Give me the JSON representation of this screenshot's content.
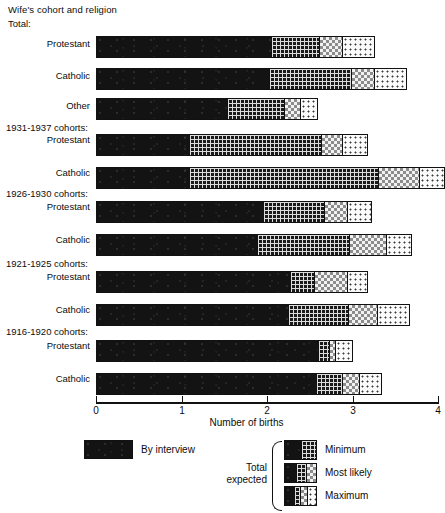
{
  "chart_data": {
    "type": "bar",
    "orientation": "horizontal",
    "stacked": true,
    "title": "",
    "xlabel": "Number of births",
    "ylabel": "Wife's cohort and religion",
    "xlim": [
      0,
      4
    ],
    "xticks": [
      "0",
      "1",
      "2",
      "3",
      "4"
    ],
    "grid": false,
    "legend_position": "below-plot",
    "series": [
      {
        "name": "By interview",
        "key": "interview"
      },
      {
        "name": "Minimum",
        "key": "minimum"
      },
      {
        "name": "Most likely",
        "key": "likely"
      },
      {
        "name": "Maximum",
        "key": "maximum"
      }
    ],
    "groups": [
      {
        "group_label": "Total:",
        "rows": [
          {
            "category": "Protestant",
            "interview": 2.05,
            "minimum": 2.62,
            "likely": 2.89,
            "maximum": 3.26
          },
          {
            "category": "Catholic",
            "interview": 2.02,
            "minimum": 2.99,
            "likely": 3.26,
            "maximum": 3.64
          },
          {
            "category": "Other",
            "interview": 1.54,
            "minimum": 2.21,
            "likely": 2.39,
            "maximum": 2.6
          }
        ]
      },
      {
        "group_label": "1931-1937 cohorts:",
        "rows": [
          {
            "category": "Protestant",
            "interview": 1.08,
            "minimum": 2.64,
            "likely": 2.89,
            "maximum": 3.18
          },
          {
            "category": "Catholic",
            "interview": 1.08,
            "minimum": 3.3,
            "likely": 3.79,
            "maximum": 4.08
          }
        ]
      },
      {
        "group_label": "1926-1930 cohorts:",
        "rows": [
          {
            "category": "Protestant",
            "interview": 1.95,
            "minimum": 2.68,
            "likely": 2.94,
            "maximum": 3.23
          },
          {
            "category": "Catholic",
            "interview": 1.88,
            "minimum": 2.97,
            "likely": 3.4,
            "maximum": 3.7
          }
        ]
      },
      {
        "group_label": "1921-1925 cohorts:",
        "rows": [
          {
            "category": "Protestant",
            "interview": 2.27,
            "minimum": 2.56,
            "likely": 2.94,
            "maximum": 3.18
          },
          {
            "category": "Catholic",
            "interview": 2.25,
            "minimum": 2.95,
            "likely": 3.3,
            "maximum": 3.67
          }
        ]
      },
      {
        "group_label": "1916-1920 cohorts:",
        "rows": [
          {
            "category": "Protestant",
            "interview": 2.6,
            "minimum": 2.74,
            "likely": 2.8,
            "maximum": 3.01
          },
          {
            "category": "Catholic",
            "interview": 2.58,
            "minimum": 2.88,
            "likely": 3.09,
            "maximum": 3.35
          }
        ]
      }
    ]
  },
  "header": {
    "axis_title": "Wife's cohort and religion"
  },
  "axis": {
    "x_label": "Number of births",
    "ticks": [
      "0",
      "1",
      "2",
      "3",
      "4"
    ]
  },
  "legend": {
    "interview_label": "By interview",
    "total_expected_line1": "Total",
    "total_expected_line2": "expected",
    "items": [
      {
        "label": "Minimum"
      },
      {
        "label": "Most likely"
      },
      {
        "label": "Maximum"
      }
    ]
  },
  "colors": {
    "ink": "#111111",
    "interview_fill": "#131313",
    "minimum_fill": "#1a1a1a",
    "likely_fill": "#f2f2f2",
    "maximum_fill": "#fafafa",
    "background": "#ffffff"
  }
}
